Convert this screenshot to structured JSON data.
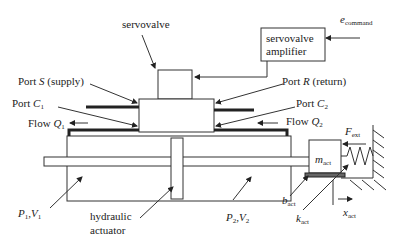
{
  "diagram": {
    "labels": {
      "servovalve": "servovalve",
      "amplifier_line1": "servovalve",
      "amplifier_line2": "amplifier",
      "e_command_main": "e",
      "e_command_sub": "command",
      "port_s_prefix": "Port ",
      "port_s_var": "S",
      "port_s_suffix": " (supply)",
      "port_r_prefix": "Port ",
      "port_r_var": "R",
      "port_r_suffix": " (return)",
      "port_c1_prefix": "Port ",
      "port_c1_var": "C",
      "port_c1_sub": "1",
      "port_c2_prefix": "Port ",
      "port_c2_var": "C",
      "port_c2_sub": "2",
      "flow_q1_prefix": "Flow ",
      "flow_q1_var": "Q",
      "flow_q1_sub": "1",
      "flow_q2_prefix": "Flow ",
      "flow_q2_var": "Q",
      "flow_q2_sub": "2",
      "f_ext_main": "F",
      "f_ext_sub": "ext",
      "m_act_main": "m",
      "m_act_sub": "act",
      "b_act_main": "b",
      "b_act_sub": "act",
      "k_act_main": "k",
      "k_act_sub": "act",
      "x_act_main": "x",
      "x_act_sub": "act",
      "p1v1_p": "P",
      "p1v1_p_sub": "1",
      "p1v1_sep": ",",
      "p1v1_v": "V",
      "p1v1_v_sub": "1",
      "p2v2_p": "P",
      "p2v2_p_sub": "2",
      "p2v2_sep": ",",
      "p2v2_v": "V",
      "p2v2_v_sub": "2",
      "actuator_line1": "hydraulic",
      "actuator_line2": "actuator"
    },
    "colors": {
      "line": "#333333",
      "pipe": "#222222",
      "background": "#ffffff"
    }
  }
}
